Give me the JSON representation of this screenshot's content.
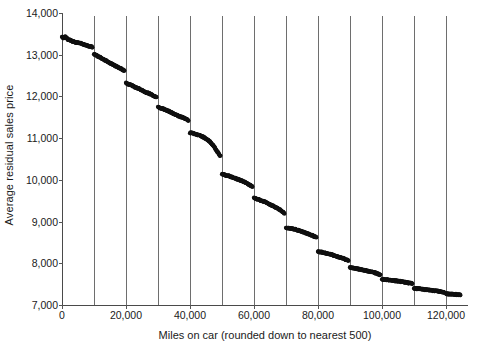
{
  "chart_data": {
    "type": "scatter",
    "title": "",
    "xlabel": "Miles on car (rounded down to nearest 500)",
    "ylabel": "Average residual sales price",
    "xlim": [
      0,
      125000
    ],
    "ylim": [
      7000,
      14000
    ],
    "grid": "vertical gridlines at every 10,000 miles",
    "legend": "none",
    "x_ticks": [
      {
        "value": 0,
        "label": "0"
      },
      {
        "value": 20000,
        "label": "20,000"
      },
      {
        "value": 40000,
        "label": "40,000"
      },
      {
        "value": 60000,
        "label": "60,000"
      },
      {
        "value": 80000,
        "label": "80,000"
      },
      {
        "value": 100000,
        "label": "100,000"
      },
      {
        "value": 120000,
        "label": "120,000"
      }
    ],
    "x_gridlines": [
      10000,
      20000,
      30000,
      40000,
      50000,
      60000,
      70000,
      80000,
      90000,
      100000,
      110000,
      120000
    ],
    "y_ticks": [
      {
        "value": 7000,
        "label": "7,000"
      },
      {
        "value": 8000,
        "label": "8,000"
      },
      {
        "value": 9000,
        "label": "9,000"
      },
      {
        "value": 10000,
        "label": "10,000"
      },
      {
        "value": 11000,
        "label": "11,000"
      },
      {
        "value": 12000,
        "label": "12,000"
      },
      {
        "value": 13000,
        "label": "13,000"
      },
      {
        "value": 14000,
        "label": "14,000"
      }
    ],
    "marker": {
      "shape": "dot",
      "color": "#111111",
      "size": 2.1
    },
    "segments": [
      {
        "x_start": 0,
        "x_end": 10000,
        "y_start": 13430,
        "y_end": 13180
      },
      {
        "x_start": 10000,
        "x_end": 20000,
        "y_start": 13010,
        "y_end": 12600
      },
      {
        "x_start": 20000,
        "x_end": 30000,
        "y_start": 12320,
        "y_end": 11960
      },
      {
        "x_start": 30000,
        "x_end": 40000,
        "y_start": 11740,
        "y_end": 11420
      },
      {
        "x_start": 40000,
        "x_end": 50000,
        "y_start": 11130,
        "y_end": 10560
      },
      {
        "x_start": 50000,
        "x_end": 60000,
        "y_start": 10130,
        "y_end": 9830
      },
      {
        "x_start": 60000,
        "x_end": 70000,
        "y_start": 9570,
        "y_end": 9180
      },
      {
        "x_start": 70000,
        "x_end": 80000,
        "y_start": 8850,
        "y_end": 8620
      },
      {
        "x_start": 80000,
        "x_end": 90000,
        "y_start": 8280,
        "y_end": 8060
      },
      {
        "x_start": 90000,
        "x_end": 100000,
        "y_start": 7900,
        "y_end": 7720
      },
      {
        "x_start": 100000,
        "x_end": 110000,
        "y_start": 7620,
        "y_end": 7510
      },
      {
        "x_start": 110000,
        "x_end": 120000,
        "y_start": 7400,
        "y_end": 7300
      },
      {
        "x_start": 120000,
        "x_end": 124500,
        "y_start": 7270,
        "y_end": 7240
      }
    ],
    "points": [
      [
        0,
        13430
      ],
      [
        500,
        13400
      ],
      [
        1000,
        13430
      ],
      [
        1500,
        13390
      ],
      [
        2000,
        13360
      ],
      [
        2500,
        13350
      ],
      [
        3000,
        13330
      ],
      [
        3500,
        13320
      ],
      [
        4000,
        13300
      ],
      [
        4500,
        13290
      ],
      [
        5000,
        13290
      ],
      [
        5500,
        13280
      ],
      [
        6000,
        13270
      ],
      [
        6500,
        13250
      ],
      [
        7000,
        13240
      ],
      [
        7500,
        13230
      ],
      [
        8000,
        13210
      ],
      [
        8500,
        13200
      ],
      [
        9000,
        13195
      ],
      [
        9500,
        13180
      ],
      [
        10000,
        13010
      ],
      [
        10500,
        12995
      ],
      [
        11000,
        12970
      ],
      [
        11500,
        12955
      ],
      [
        12000,
        12935
      ],
      [
        12500,
        12910
      ],
      [
        13000,
        12890
      ],
      [
        13500,
        12865
      ],
      [
        14000,
        12845
      ],
      [
        14500,
        12820
      ],
      [
        15000,
        12800
      ],
      [
        15500,
        12780
      ],
      [
        16000,
        12760
      ],
      [
        16500,
        12740
      ],
      [
        17000,
        12720
      ],
      [
        17500,
        12700
      ],
      [
        18000,
        12680
      ],
      [
        18500,
        12660
      ],
      [
        19000,
        12635
      ],
      [
        19500,
        12610
      ],
      [
        20000,
        12320
      ],
      [
        20500,
        12300
      ],
      [
        21000,
        12285
      ],
      [
        21500,
        12270
      ],
      [
        22000,
        12255
      ],
      [
        22500,
        12235
      ],
      [
        23000,
        12215
      ],
      [
        23500,
        12200
      ],
      [
        24000,
        12185
      ],
      [
        24500,
        12165
      ],
      [
        25000,
        12150
      ],
      [
        25500,
        12130
      ],
      [
        26000,
        12110
      ],
      [
        26500,
        12090
      ],
      [
        27000,
        12075
      ],
      [
        27500,
        12060
      ],
      [
        28000,
        12040
      ],
      [
        28500,
        12020
      ],
      [
        29000,
        12000
      ],
      [
        29500,
        11975
      ],
      [
        30000,
        11740
      ],
      [
        30500,
        11730
      ],
      [
        31000,
        11720
      ],
      [
        31500,
        11705
      ],
      [
        32000,
        11690
      ],
      [
        32500,
        11670
      ],
      [
        33000,
        11655
      ],
      [
        33500,
        11640
      ],
      [
        34000,
        11620
      ],
      [
        34500,
        11600
      ],
      [
        35000,
        11585
      ],
      [
        35500,
        11570
      ],
      [
        36000,
        11550
      ],
      [
        36500,
        11530
      ],
      [
        37000,
        11515
      ],
      [
        37500,
        11500
      ],
      [
        38000,
        11485
      ],
      [
        38500,
        11465
      ],
      [
        39000,
        11445
      ],
      [
        39500,
        11425
      ],
      [
        40000,
        11130
      ],
      [
        40500,
        11125
      ],
      [
        41000,
        11115
      ],
      [
        41500,
        11100
      ],
      [
        42000,
        11085
      ],
      [
        42500,
        11075
      ],
      [
        43000,
        11060
      ],
      [
        43500,
        11045
      ],
      [
        44000,
        11030
      ],
      [
        44500,
        11010
      ],
      [
        45000,
        10990
      ],
      [
        45500,
        10960
      ],
      [
        46000,
        10930
      ],
      [
        46500,
        10890
      ],
      [
        47000,
        10850
      ],
      [
        47500,
        10800
      ],
      [
        48000,
        10740
      ],
      [
        48500,
        10680
      ],
      [
        49000,
        10620
      ],
      [
        49500,
        10565
      ],
      [
        50000,
        10130
      ],
      [
        50500,
        10125
      ],
      [
        51000,
        10115
      ],
      [
        51500,
        10105
      ],
      [
        52000,
        10095
      ],
      [
        52500,
        10080
      ],
      [
        53000,
        10070
      ],
      [
        53500,
        10055
      ],
      [
        54000,
        10040
      ],
      [
        54500,
        10025
      ],
      [
        55000,
        10010
      ],
      [
        55500,
        9995
      ],
      [
        56000,
        9980
      ],
      [
        56500,
        9965
      ],
      [
        57000,
        9945
      ],
      [
        57500,
        9925
      ],
      [
        58000,
        9905
      ],
      [
        58500,
        9885
      ],
      [
        59000,
        9860
      ],
      [
        59500,
        9835
      ],
      [
        60000,
        9570
      ],
      [
        60500,
        9555
      ],
      [
        61000,
        9540
      ],
      [
        61500,
        9525
      ],
      [
        62000,
        9510
      ],
      [
        62500,
        9495
      ],
      [
        63000,
        9480
      ],
      [
        63500,
        9465
      ],
      [
        64000,
        9445
      ],
      [
        64500,
        9425
      ],
      [
        65000,
        9410
      ],
      [
        65500,
        9390
      ],
      [
        66000,
        9370
      ],
      [
        66500,
        9350
      ],
      [
        67000,
        9330
      ],
      [
        67500,
        9310
      ],
      [
        68000,
        9285
      ],
      [
        68500,
        9255
      ],
      [
        69000,
        9225
      ],
      [
        69500,
        9190
      ],
      [
        70000,
        8850
      ],
      [
        70500,
        8845
      ],
      [
        71000,
        8840
      ],
      [
        71500,
        8835
      ],
      [
        72000,
        8830
      ],
      [
        72500,
        8820
      ],
      [
        73000,
        8810
      ],
      [
        73500,
        8800
      ],
      [
        74000,
        8790
      ],
      [
        74500,
        8775
      ],
      [
        75000,
        8760
      ],
      [
        75500,
        8745
      ],
      [
        76000,
        8730
      ],
      [
        76500,
        8715
      ],
      [
        77000,
        8700
      ],
      [
        77500,
        8685
      ],
      [
        78000,
        8670
      ],
      [
        78500,
        8655
      ],
      [
        79000,
        8640
      ],
      [
        79500,
        8625
      ],
      [
        80000,
        8280
      ],
      [
        80500,
        8275
      ],
      [
        81000,
        8268
      ],
      [
        81500,
        8260
      ],
      [
        82000,
        8250
      ],
      [
        82500,
        8240
      ],
      [
        83000,
        8230
      ],
      [
        83500,
        8220
      ],
      [
        84000,
        8210
      ],
      [
        84500,
        8198
      ],
      [
        85000,
        8186
      ],
      [
        85500,
        8175
      ],
      [
        86000,
        8163
      ],
      [
        86500,
        8150
      ],
      [
        87000,
        8138
      ],
      [
        87500,
        8125
      ],
      [
        88000,
        8112
      ],
      [
        88500,
        8098
      ],
      [
        89000,
        8082
      ],
      [
        89500,
        8065
      ],
      [
        90000,
        7900
      ],
      [
        90500,
        7895
      ],
      [
        91000,
        7888
      ],
      [
        91500,
        7880
      ],
      [
        92000,
        7872
      ],
      [
        92500,
        7864
      ],
      [
        93000,
        7856
      ],
      [
        93500,
        7848
      ],
      [
        94000,
        7840
      ],
      [
        94500,
        7832
      ],
      [
        95000,
        7824
      ],
      [
        95500,
        7814
      ],
      [
        96000,
        7805
      ],
      [
        96500,
        7795
      ],
      [
        97000,
        7785
      ],
      [
        97500,
        7775
      ],
      [
        98000,
        7764
      ],
      [
        98500,
        7752
      ],
      [
        99000,
        7738
      ],
      [
        99500,
        7724
      ],
      [
        100000,
        7620
      ],
      [
        100500,
        7616
      ],
      [
        101000,
        7612
      ],
      [
        101500,
        7608
      ],
      [
        102000,
        7603
      ],
      [
        102500,
        7598
      ],
      [
        103000,
        7593
      ],
      [
        103500,
        7588
      ],
      [
        104000,
        7582
      ],
      [
        104500,
        7577
      ],
      [
        105000,
        7572
      ],
      [
        105500,
        7566
      ],
      [
        106000,
        7560
      ],
      [
        106500,
        7554
      ],
      [
        107000,
        7548
      ],
      [
        107500,
        7542
      ],
      [
        108000,
        7535
      ],
      [
        108500,
        7528
      ],
      [
        109000,
        7521
      ],
      [
        109500,
        7514
      ],
      [
        110000,
        7400
      ],
      [
        110500,
        7396
      ],
      [
        111000,
        7392
      ],
      [
        111500,
        7388
      ],
      [
        112000,
        7384
      ],
      [
        112500,
        7379
      ],
      [
        113000,
        7374
      ],
      [
        113500,
        7370
      ],
      [
        114000,
        7365
      ],
      [
        114500,
        7360
      ],
      [
        115000,
        7355
      ],
      [
        115500,
        7350
      ],
      [
        116000,
        7345
      ],
      [
        116500,
        7340
      ],
      [
        117000,
        7334
      ],
      [
        117500,
        7328
      ],
      [
        118000,
        7322
      ],
      [
        118500,
        7316
      ],
      [
        119000,
        7310
      ],
      [
        119500,
        7304
      ],
      [
        120000,
        7270
      ],
      [
        120500,
        7267
      ],
      [
        121000,
        7264
      ],
      [
        121500,
        7262
      ],
      [
        122000,
        7259
      ],
      [
        122500,
        7256
      ],
      [
        123000,
        7253
      ],
      [
        123500,
        7250
      ],
      [
        124000,
        7246
      ],
      [
        124500,
        7242
      ]
    ]
  },
  "caption": ""
}
